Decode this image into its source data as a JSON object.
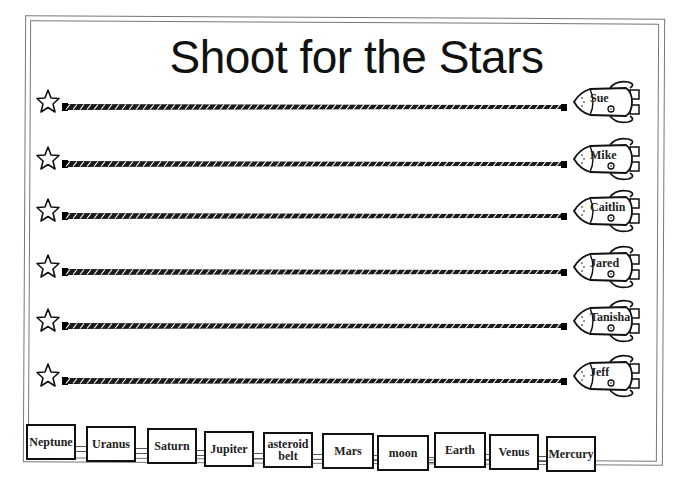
{
  "title": "Shoot for the Stars",
  "rows": [
    {
      "name": "Sue"
    },
    {
      "name": "Mike"
    },
    {
      "name": "Caitlin"
    },
    {
      "name": "Jared"
    },
    {
      "name": "Tanisha"
    },
    {
      "name": "Jeff"
    }
  ],
  "planets": [
    {
      "label": "Neptune"
    },
    {
      "label": "Uranus"
    },
    {
      "label": "Saturn"
    },
    {
      "label": "Jupiter"
    },
    {
      "label": "asteroid belt"
    },
    {
      "label": "Mars"
    },
    {
      "label": "moon"
    },
    {
      "label": "Earth"
    },
    {
      "label": "Venus"
    },
    {
      "label": "Mercury"
    }
  ],
  "icons": {
    "star": "star-outline-icon",
    "rocket": "rocket-icon",
    "rope": "rope-track"
  }
}
